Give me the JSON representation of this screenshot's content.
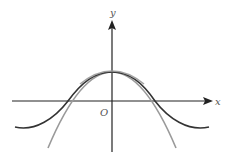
{
  "diagram": {
    "axes": {
      "x_label": "x",
      "y_label": "y",
      "origin_label": "O",
      "color": "#222222"
    },
    "curves": [
      {
        "name": "cosine-curve",
        "description": "y = cos x (dark)",
        "color": "#333333"
      },
      {
        "name": "parabola-curve",
        "description": "downward parabola (gray)",
        "color": "#9a9a9a"
      }
    ]
  }
}
